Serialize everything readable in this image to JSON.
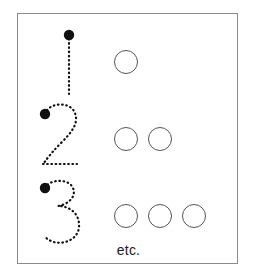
{
  "worksheet": {
    "title": "Number tracing and counting worksheet",
    "footer_label": "etc.",
    "frame_color": "#8a8a8a",
    "background_color": "#ffffff",
    "trace_color": "#111111",
    "circle_outline_color": "#555555",
    "rows": [
      {
        "numeral": "1",
        "numeral_name": "dotted-numeral-one",
        "start_dot": true,
        "circle_count": 1,
        "circle_labels": [
          "circle-1"
        ]
      },
      {
        "numeral": "2",
        "numeral_name": "dotted-numeral-two",
        "start_dot": true,
        "circle_count": 2,
        "circle_labels": [
          "circle-1",
          "circle-2"
        ]
      },
      {
        "numeral": "3",
        "numeral_name": "dotted-numeral-three",
        "start_dot": true,
        "circle_count": 3,
        "circle_labels": [
          "circle-1",
          "circle-2",
          "circle-3"
        ]
      }
    ]
  }
}
